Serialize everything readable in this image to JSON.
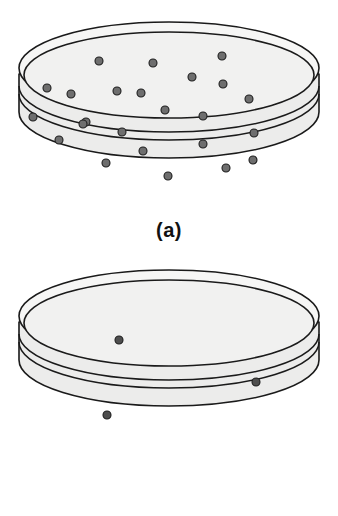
{
  "figure": {
    "panels": [
      {
        "id": "a",
        "caption": "(a)",
        "label": "dish-a",
        "description": "Petri dish with many bacterial colonies",
        "colony_count": 24,
        "colony_radius": 4.0,
        "colonies": [
          {
            "cx": 99,
            "cy": 61
          },
          {
            "cx": 153,
            "cy": 63
          },
          {
            "cx": 222,
            "cy": 56
          },
          {
            "cx": 47,
            "cy": 88
          },
          {
            "cx": 71,
            "cy": 94
          },
          {
            "cx": 117,
            "cy": 91
          },
          {
            "cx": 141,
            "cy": 93
          },
          {
            "cx": 192,
            "cy": 77
          },
          {
            "cx": 223,
            "cy": 84
          },
          {
            "cx": 33,
            "cy": 117
          },
          {
            "cx": 86,
            "cy": 122
          },
          {
            "cx": 165,
            "cy": 110
          },
          {
            "cx": 249,
            "cy": 99
          },
          {
            "cx": 203,
            "cy": 116
          },
          {
            "cx": 83,
            "cy": 124
          },
          {
            "cx": 122,
            "cy": 132
          },
          {
            "cx": 254,
            "cy": 133
          },
          {
            "cx": 59,
            "cy": 140
          },
          {
            "cx": 143,
            "cy": 151
          },
          {
            "cx": 203,
            "cy": 144
          },
          {
            "cx": 106,
            "cy": 163
          },
          {
            "cx": 226,
            "cy": 168
          },
          {
            "cx": 168,
            "cy": 176
          },
          {
            "cx": 253,
            "cy": 160
          }
        ]
      },
      {
        "id": "b",
        "caption": "(b)",
        "label": "dish-b",
        "description": "Petri dish with only three bacterial colonies",
        "colony_count": 3,
        "colony_radius": 4.0,
        "colonies": [
          {
            "cx": 119,
            "cy": 80
          },
          {
            "cx": 256,
            "cy": 122
          },
          {
            "cx": 107,
            "cy": 155
          }
        ]
      }
    ]
  },
  "geometry": {
    "dish": {
      "center_x": 169,
      "lid_top_cy": 68,
      "lid_inner_cy": 74,
      "rx": 150,
      "ry": 46,
      "wall_drop": 38,
      "rim_band": 10
    }
  },
  "colors": {
    "background": "#ffffff",
    "dish_fill": "#f1f1f0",
    "dish_side_fill": "#ececeb",
    "outline": "#1a1a1a",
    "colony_fill": "#6e6e6e",
    "colony_fill_sparse": "#4e4e4e",
    "colony_stroke": "#1f1f1f",
    "caption_color": "#111111"
  }
}
